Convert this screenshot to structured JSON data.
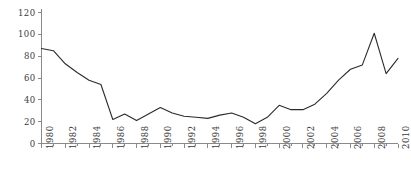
{
  "chart_data": {
    "type": "line",
    "title": "",
    "subtitle": "",
    "xlabel": "",
    "ylabel": "",
    "legend": [],
    "legend_position": "none",
    "grid": false,
    "xlim": [
      1980,
      2010
    ],
    "ylim": [
      0,
      120
    ],
    "ytick_values": [
      0,
      20,
      40,
      60,
      80,
      100,
      120
    ],
    "ytick_labels": [
      "0",
      "20",
      "40",
      "60",
      "80",
      "100",
      "120"
    ],
    "xtick_labels": [
      "1980",
      "1982",
      "1984",
      "1986",
      "1988",
      "1990",
      "1992",
      "1994",
      "1996",
      "1998",
      "2000",
      "2002",
      "2004",
      "2006",
      "2008",
      "2010"
    ],
    "xtick_values": [
      1980,
      1982,
      1984,
      1986,
      1988,
      1990,
      1992,
      1994,
      1996,
      1998,
      2000,
      2002,
      2004,
      2006,
      2008,
      2010
    ],
    "xtick_minor_values": [
      1981,
      1983,
      1985,
      1987,
      1989,
      1991,
      1993,
      1995,
      1997,
      1999,
      2001,
      2003,
      2005,
      2007,
      2009
    ],
    "x": [
      1980,
      1981,
      1982,
      1983,
      1984,
      1985,
      1986,
      1987,
      1988,
      1989,
      1990,
      1991,
      1992,
      1993,
      1994,
      1995,
      1996,
      1997,
      1998,
      1999,
      2000,
      2001,
      2002,
      2003,
      2004,
      2005,
      2006,
      2007,
      2008,
      2009,
      2010
    ],
    "values": [
      87,
      85,
      73,
      65,
      58,
      54,
      22,
      27,
      21,
      27,
      33,
      28,
      25,
      24,
      23,
      26,
      28,
      24,
      18,
      24,
      35,
      31,
      31,
      36,
      46,
      58,
      68,
      72,
      101,
      64,
      78
    ],
    "line_color": "#2b2b2b",
    "axis_color": "#8a8a8a",
    "tick_text_color": "#3a3a3a",
    "background_color": "#ffffff",
    "line_width": 1.1,
    "markers": false
  },
  "axes": {
    "y_axis_name": "y-axis",
    "x_axis_name": "x-axis"
  }
}
